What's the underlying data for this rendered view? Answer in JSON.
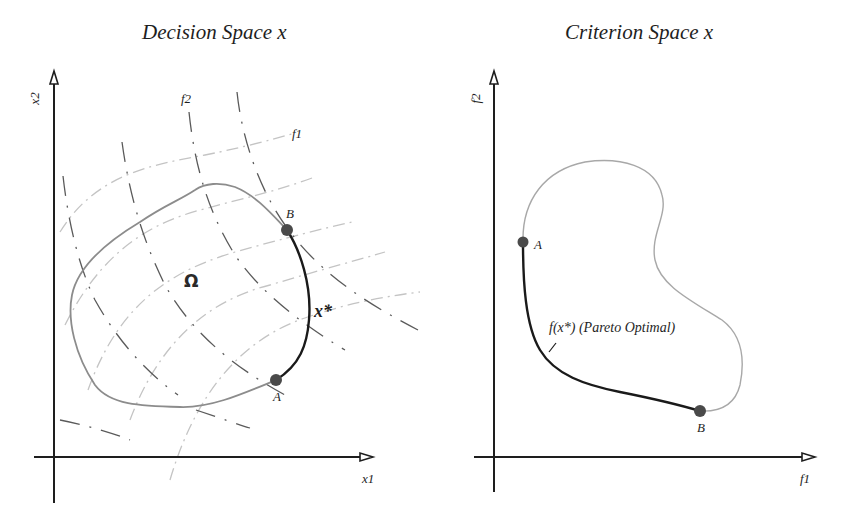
{
  "figure": {
    "left_panel": {
      "title": "Decision Space x",
      "x_axis_label": "x1",
      "y_axis_label": "x2",
      "region_label": "Ω",
      "contour_labels": {
        "f1": "f1",
        "f2": "f2"
      },
      "pareto_set_label": "x*",
      "points": [
        {
          "name": "A",
          "label": "A"
        },
        {
          "name": "B",
          "label": "B"
        }
      ]
    },
    "right_panel": {
      "title": "Criterion Space x",
      "x_axis_label": "f1",
      "y_axis_label": "f2",
      "pareto_front_label": "f(x*) (Pareto Optimal)",
      "points": [
        {
          "name": "A",
          "label": "A"
        },
        {
          "name": "B",
          "label": "B"
        }
      ]
    },
    "colors": {
      "axis": "#1e1e1e",
      "region_boundary_left": "#8c8c8c",
      "region_boundary_right": "#a8a8a8",
      "pareto_curve": "#1a1a1a",
      "point_fill": "#4a4a4a",
      "f2_contours": "#5a5a5a",
      "f1_contours": "#c4c4c4"
    }
  }
}
